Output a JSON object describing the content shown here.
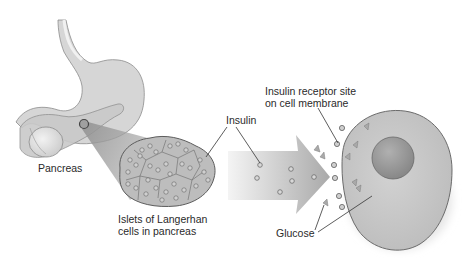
{
  "diagram": {
    "labels": {
      "pancreas": "Pancreas",
      "islets_line1": "Islets of Langerhan",
      "islets_line2": "cells in pancreas",
      "insulin": "Insulin",
      "receptor_line1": "Insulin receptor site",
      "receptor_line2": "on cell membrane",
      "glucose": "Glucose"
    },
    "components": [
      {
        "name": "stomach",
        "shape": "organ"
      },
      {
        "name": "pancreas",
        "shape": "organ"
      },
      {
        "name": "islet-highlight",
        "shape": "circle"
      },
      {
        "name": "islets-of-langerhans",
        "shape": "cell-cluster"
      },
      {
        "name": "flow-arrow",
        "shape": "arrow",
        "direction": "right"
      },
      {
        "name": "insulin-molecules",
        "shape": "small-circles",
        "count": 6
      },
      {
        "name": "glucose-molecules",
        "shape": "triangles",
        "count": 8
      },
      {
        "name": "target-cell",
        "shape": "cell"
      },
      {
        "name": "nucleus",
        "shape": "circle"
      },
      {
        "name": "receptor-sites",
        "shape": "small-circles",
        "count": 6
      }
    ],
    "colors": {
      "organ_fill": "#d4d4d4",
      "organ_stroke": "#8a8a8a",
      "cell_fill": "#c8c8c8",
      "nucleus_fill": "#9a9a9a",
      "arrow_dark": "#a8a8a8",
      "arrow_light": "#f2f2f2",
      "text": "#2a2a2a"
    }
  }
}
